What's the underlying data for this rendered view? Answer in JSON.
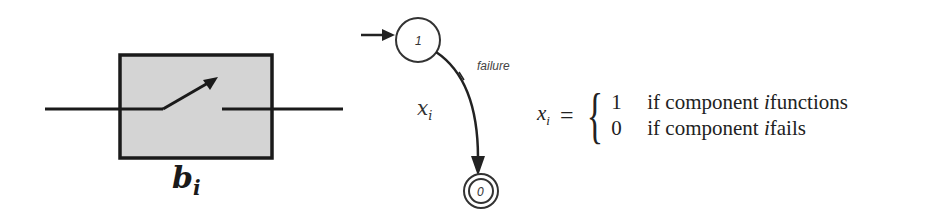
{
  "block": {
    "label_base": "b",
    "label_sub": "i",
    "box_fill": "#d4d4d4",
    "stroke": "#1a1a1a"
  },
  "state_diagram": {
    "states": [
      {
        "label": "1",
        "initial": true,
        "accepting": false
      },
      {
        "label": "0",
        "initial": false,
        "accepting": true
      }
    ],
    "transition": {
      "from": "1",
      "to": "0",
      "label": "failure"
    },
    "variable_base": "x",
    "variable_sub": "i"
  },
  "formula": {
    "lhs_base": "x",
    "lhs_sub": "i",
    "equals": "=",
    "brace": "{",
    "cases": [
      {
        "value": "1",
        "text_prefix": "if component ",
        "var": "i",
        "text_suffix": " functions"
      },
      {
        "value": "0",
        "text_prefix": "if component ",
        "var": "i",
        "text_suffix": " fails"
      }
    ]
  }
}
